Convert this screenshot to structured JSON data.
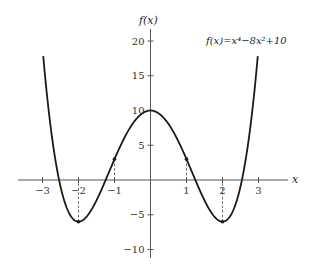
{
  "chart_data": {
    "type": "line",
    "function": "x^4 - 8x^2 + 10",
    "xlabel": "x",
    "ylabel": "f(x)",
    "xlim": [
      -3.0,
      3.0
    ],
    "ylim": [
      -10,
      20
    ],
    "x_ticks": [
      -3,
      -2,
      -1,
      1,
      2,
      3
    ],
    "y_ticks": [
      -10,
      -5,
      5,
      10,
      15,
      20
    ],
    "x_tick_labels": [
      "−3",
      "−2",
      "−1",
      "1",
      "2",
      "3"
    ],
    "y_tick_labels": [
      "−10",
      "−5",
      "5",
      "10",
      "15",
      "20"
    ],
    "grid": false,
    "legend": null,
    "series": [
      {
        "name": "f(x)",
        "x": [
          -3,
          -2.5,
          -2,
          -1.5,
          -1,
          -0.5,
          0,
          0.5,
          1,
          1.5,
          2,
          2.5,
          3
        ],
        "values": [
          19,
          0.0625,
          -6,
          -3.9375,
          3,
          8.0625,
          10,
          8.0625,
          3,
          -3.9375,
          -6,
          0.0625,
          19
        ]
      }
    ],
    "marked_points": [
      {
        "x": -2,
        "y": -6,
        "dashed_to_axis": true
      },
      {
        "x": -1,
        "y": 3,
        "dashed_to_axis": true
      },
      {
        "x": 1,
        "y": 3,
        "dashed_to_axis": true
      },
      {
        "x": 2,
        "y": -6,
        "dashed_to_axis": true
      }
    ],
    "annotations": [
      {
        "text": "f(x)=x⁴−8x²+10",
        "position": "upper right"
      }
    ]
  },
  "labels": {
    "ylabel": "f(x)",
    "xlabel": "x",
    "formula": "f(x)=x⁴−8x²+10"
  },
  "colors": {
    "curve": "#1a1a1a",
    "axis": "#555555",
    "dashed": "#555555"
  }
}
